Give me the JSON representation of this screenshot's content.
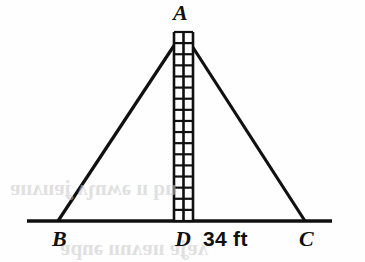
{
  "figure": {
    "background_color": "#fefefe",
    "stroke_color": "#101010",
    "labels": {
      "apex": "A",
      "base_left": "B",
      "base_mid": "D",
      "base_right": "C",
      "measure": "34 ft"
    },
    "geometry": {
      "apex": {
        "x": 183,
        "y": 32
      },
      "base_left_vertex": {
        "x": 58,
        "y": 221
      },
      "base_right_vertex": {
        "x": 305,
        "y": 221
      },
      "base_mid_point": {
        "x": 183,
        "y": 221
      },
      "baseline_start_x": 27,
      "baseline_end_x": 332,
      "baseline_y": 221,
      "side_stroke_width": 3.2,
      "baseline_stroke_width": 3.6
    },
    "ladder": {
      "name": "ladder",
      "left_x": 174,
      "right_x": 193,
      "top_y": 32,
      "bottom_y": 221,
      "columns": 2,
      "rows": 17,
      "rail_stroke_width": 2.6,
      "rung_stroke_width": 2.2,
      "fill_color": "#ffffff"
    },
    "bleed_through": {
      "line_1": "uq ıı ǝʍnʅʌ ʝɐııʌııɐ",
      "line_2": "ʌɐʝɐ ııɐʌnıı ǝnpɐ"
    }
  }
}
